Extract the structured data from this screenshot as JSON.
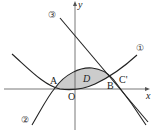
{
  "diagram": {
    "type": "function-graph",
    "axes": {
      "x_label": "x",
      "y_label": "y",
      "origin_label": "O"
    },
    "curves": [
      {
        "id": "curve-1",
        "label": "①",
        "description": "upward parabola"
      },
      {
        "id": "curve-2",
        "label": "②",
        "description": "cubic curve"
      },
      {
        "id": "line-3",
        "label": "③",
        "description": "straight line"
      }
    ],
    "points": [
      {
        "label": "A"
      },
      {
        "label": "B"
      },
      {
        "label": "C'"
      }
    ],
    "region": {
      "label": "D",
      "fill": "#cccccc"
    }
  }
}
